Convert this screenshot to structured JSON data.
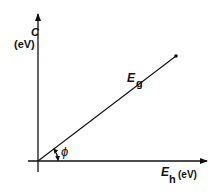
{
  "diagram": {
    "y_axis": {
      "symbol": "C",
      "unit": "(eV)"
    },
    "x_axis": {
      "symbol": "E",
      "subscript": "h",
      "unit": "(eV)"
    },
    "line": {
      "symbol": "E",
      "subscript": "g"
    },
    "angle": {
      "symbol": "ϕ"
    }
  },
  "colors": {
    "ink": "#111111",
    "background": "#ffffff"
  }
}
